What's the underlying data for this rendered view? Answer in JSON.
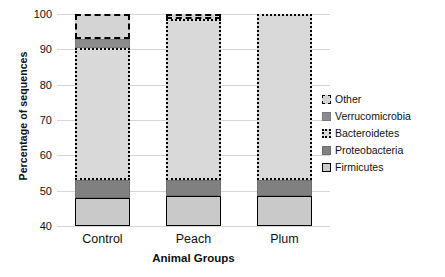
{
  "chart_data": {
    "type": "bar",
    "stacked": true,
    "title": "",
    "xlabel": "Animal Groups",
    "ylabel": "Percentage of sequences",
    "categories": [
      "Control",
      "Peach",
      "Plum"
    ],
    "ylim": [
      40,
      100
    ],
    "yticks": [
      40,
      50,
      60,
      70,
      80,
      90,
      100
    ],
    "ytick_labels": [
      "40",
      "50",
      "60",
      "70",
      "80",
      "90",
      "100"
    ],
    "grid": true,
    "legend_position": "right",
    "series": [
      {
        "name": "Firmicutes",
        "color": "#c9c9c9",
        "pattern": "solid-outline",
        "values": [
          8.0,
          8.5,
          8.5
        ],
        "cumulative_top": [
          48.0,
          48.5,
          48.5
        ]
      },
      {
        "name": "Proteobacteria",
        "color": "#808080",
        "pattern": "solid-fill",
        "values": [
          5.0,
          4.5,
          4.5
        ],
        "cumulative_top": [
          53.0,
          53.0,
          53.0
        ]
      },
      {
        "name": "Bacteroidetes",
        "color": "#d9d9d9",
        "pattern": "dotted-outline",
        "values": [
          37.5,
          45.5,
          47.0
        ],
        "cumulative_top": [
          90.5,
          98.5,
          100.0
        ]
      },
      {
        "name": "Verrucomicrobia",
        "color": "#8c8c8c",
        "pattern": "solid-fill",
        "values": [
          2.5,
          0.0,
          0.0
        ],
        "cumulative_top": [
          93.0,
          98.5,
          100.0
        ]
      },
      {
        "name": "Other",
        "color": "#d4d4d4",
        "pattern": "dash-dot-outline",
        "values": [
          7.0,
          1.5,
          0.0
        ],
        "cumulative_top": [
          100.0,
          100.0,
          100.0
        ]
      }
    ],
    "legend_entries": [
      "Other",
      "Verrucomicrobia",
      "Bacteroidetes",
      "Proteobacteria",
      "Firmicutes"
    ]
  }
}
